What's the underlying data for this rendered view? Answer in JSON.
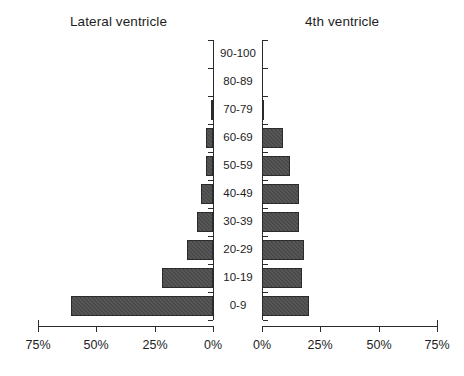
{
  "chart_data": {
    "type": "bar",
    "title": "",
    "subtitle": "",
    "orientation": "horizontal",
    "layout": "population-pyramid",
    "categories": [
      "90-100",
      "80-89",
      "70-79",
      "60-69",
      "50-59",
      "40-49",
      "30-39",
      "20-29",
      "10-19",
      "0-9"
    ],
    "xlabel": "",
    "ylabel": "",
    "xlim": [
      0,
      75
    ],
    "xticks": [
      0,
      25,
      50,
      75
    ],
    "xtick_labels": [
      "0%",
      "25%",
      "50%",
      "75%"
    ],
    "grid": false,
    "legend": "none",
    "series": [
      {
        "name": "Lateral ventricle",
        "side": "left",
        "axis_direction": "reversed",
        "axis_tick_labels": [
          "75%",
          "50%",
          "25%",
          "0%"
        ],
        "values": [
          0,
          0,
          1,
          3,
          3,
          5,
          7,
          11,
          22,
          61
        ]
      },
      {
        "name": "4th ventricle",
        "side": "right",
        "axis_direction": "normal",
        "axis_tick_labels": [
          "0%",
          "25%",
          "50%",
          "75%"
        ],
        "values": [
          0,
          0,
          1,
          9,
          12,
          16,
          16,
          18,
          17,
          20
        ]
      }
    ]
  },
  "panels": {
    "left_title": "Lateral ventricle",
    "right_title": "4th ventricle"
  },
  "axis": {
    "left_tick_labels": [
      "75%",
      "50%",
      "25%",
      "0%"
    ],
    "right_tick_labels": [
      "0%",
      "25%",
      "50%",
      "75%"
    ]
  },
  "colors": {
    "bar_fill": "#4a4a4a",
    "bar_border": "#2b2b2b",
    "axis": "#2b2b2b",
    "text": "#1d1d1d",
    "background": "#ffffff"
  }
}
